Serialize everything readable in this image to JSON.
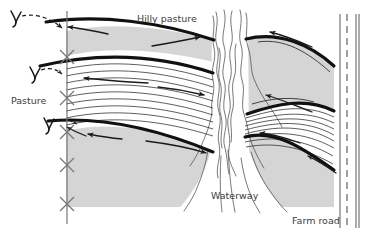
{
  "figure": {
    "type": "diagram",
    "background_color": "#ffffff",
    "field_fill_color": "#d5d5d5",
    "line_color": "#1a1a1a",
    "text_color": "#3c3c3c"
  },
  "labels": {
    "hilly_pasture": "Hilly pasture",
    "pasture": "Pasture",
    "waterway": "Waterway",
    "farm_road": "Farm road"
  },
  "legend_features": {
    "fence_line": "fence-with-x-posts",
    "terrace_line": "bold-terrace-ridge-line",
    "contour_line": "thin-contour-crop-row-line",
    "flow_arrow": "runoff-flow-direction-arrow",
    "outlet_symbol": "terrace-outlet-Y-symbol",
    "waterway_band": "grassed-waterway-wavy-band",
    "road_band": "farm-road-with-dashed-centerline"
  },
  "counts": {
    "fence_posts": 5,
    "outlet_symbols": 3,
    "terrace_lines_left": 3,
    "terrace_lines_right": 3,
    "flow_arrows": 11
  }
}
